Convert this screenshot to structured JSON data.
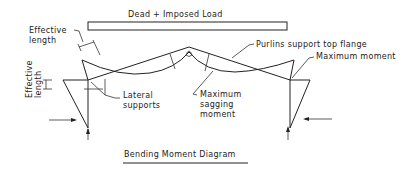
{
  "diagram": {
    "load_label": "Dead + Imposed Load",
    "caption": "Bending Moment Diagram",
    "annotations": {
      "effective_length_top_1": "Effective",
      "effective_length_top_2": "length",
      "effective_length_side_1": "Effective",
      "effective_length_side_2": "length",
      "lateral_supports_1": "Lateral",
      "lateral_supports_2": "supports",
      "max_sagging_1": "Maximum",
      "max_sagging_2": "sagging",
      "max_sagging_3": "moment",
      "purlins": "Purlins support top flange",
      "max_moment": "Maximum moment"
    },
    "colors": {
      "ink": "#222222",
      "background": "#ffffff"
    }
  }
}
